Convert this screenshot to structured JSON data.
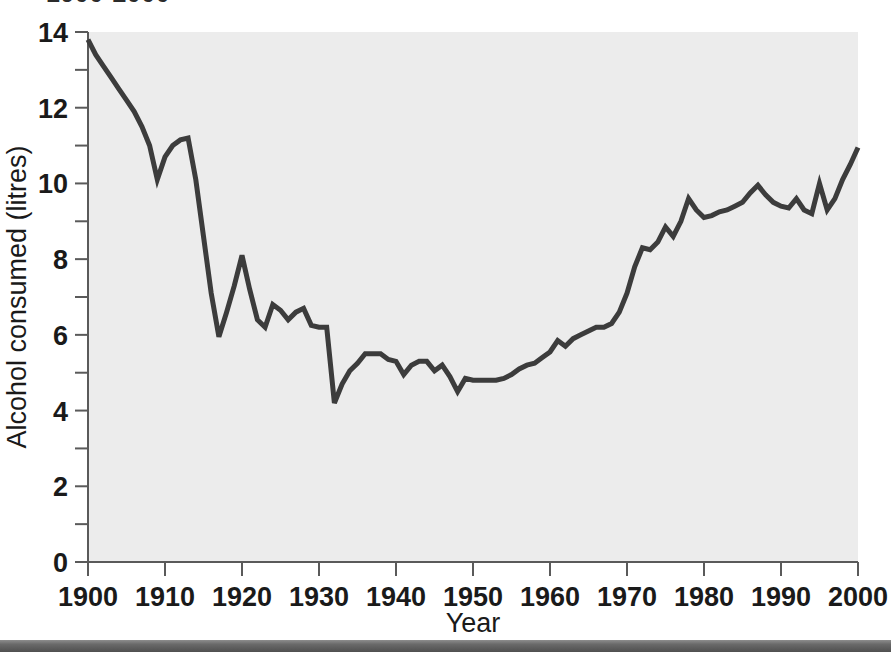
{
  "figure": {
    "cut_off_title": "1900-2000",
    "background_color": "#ffffff",
    "plot_background_color": "#ececec",
    "line_color": "#3c3c3c",
    "axis_color": "#5a5a5a"
  },
  "axes": {
    "x": {
      "title": "Year",
      "tick_labels": [
        "1900",
        "1910",
        "1920",
        "1930",
        "1940",
        "1950",
        "1960",
        "1970",
        "1980",
        "1990",
        "2000"
      ],
      "range": [
        1900,
        2000
      ],
      "major_tick_step": 10
    },
    "y": {
      "title": "Alcohol consumed (litres)",
      "tick_labels": [
        "0",
        "2",
        "4",
        "6",
        "8",
        "10",
        "12",
        "14"
      ],
      "range": [
        0,
        14
      ],
      "major_tick_step": 2,
      "minor_tick_step": 1
    }
  },
  "chart_data": {
    "type": "line",
    "title": "1900-2000",
    "xlabel": "Year",
    "ylabel": "Alcohol consumed (litres)",
    "xlim": [
      1900,
      2000
    ],
    "ylim": [
      0,
      14
    ],
    "grid": false,
    "legend": null,
    "series": [
      {
        "name": "Alcohol consumed (litres)",
        "x": [
          1900,
          1901,
          1902,
          1903,
          1904,
          1905,
          1906,
          1907,
          1908,
          1909,
          1910,
          1911,
          1912,
          1913,
          1914,
          1915,
          1916,
          1917,
          1918,
          1919,
          1920,
          1921,
          1922,
          1923,
          1924,
          1925,
          1926,
          1927,
          1928,
          1929,
          1930,
          1931,
          1932,
          1933,
          1934,
          1935,
          1936,
          1937,
          1938,
          1939,
          1940,
          1941,
          1942,
          1943,
          1944,
          1945,
          1946,
          1947,
          1948,
          1949,
          1950,
          1951,
          1952,
          1953,
          1954,
          1955,
          1956,
          1957,
          1958,
          1959,
          1960,
          1961,
          1962,
          1963,
          1964,
          1965,
          1966,
          1967,
          1968,
          1969,
          1970,
          1971,
          1972,
          1973,
          1974,
          1975,
          1976,
          1977,
          1978,
          1979,
          1980,
          1981,
          1982,
          1983,
          1984,
          1985,
          1986,
          1987,
          1988,
          1989,
          1990,
          1991,
          1992,
          1993,
          1994,
          1995,
          1996,
          1997,
          1998,
          1999,
          2000
        ],
        "y": [
          13.8,
          13.4,
          13.1,
          12.8,
          12.5,
          12.2,
          11.9,
          11.5,
          11.0,
          10.1,
          10.7,
          11.0,
          11.15,
          11.2,
          10.1,
          8.6,
          7.1,
          5.95,
          6.6,
          7.3,
          8.1,
          7.2,
          6.4,
          6.2,
          6.8,
          6.65,
          6.4,
          6.6,
          6.7,
          6.25,
          6.2,
          6.2,
          4.2,
          4.7,
          5.05,
          5.25,
          5.5,
          5.5,
          5.5,
          5.35,
          5.3,
          4.95,
          5.2,
          5.3,
          5.3,
          5.05,
          5.2,
          4.9,
          4.5,
          4.85,
          4.8,
          4.8,
          4.8,
          4.8,
          4.85,
          4.95,
          5.1,
          5.2,
          5.25,
          5.4,
          5.55,
          5.85,
          5.7,
          5.9,
          6.0,
          6.1,
          6.2,
          6.2,
          6.3,
          6.6,
          7.1,
          7.8,
          8.3,
          8.25,
          8.45,
          8.85,
          8.6,
          9.0,
          9.6,
          9.3,
          9.1,
          9.15,
          9.25,
          9.3,
          9.4,
          9.5,
          9.75,
          9.95,
          9.7,
          9.5,
          9.4,
          9.35,
          9.6,
          9.3,
          9.2,
          10.0,
          9.3,
          9.6,
          10.1,
          10.5,
          10.95
        ]
      }
    ]
  }
}
